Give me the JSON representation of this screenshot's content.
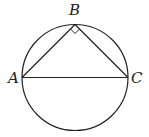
{
  "figure": {
    "type": "inscribed-triangle-in-circle",
    "stroke_color": "#222222"
  },
  "points": {
    "A": {
      "label": "A"
    },
    "B": {
      "label": "B"
    },
    "C": {
      "label": "C"
    }
  },
  "annotations": {
    "right_angle_at": "B"
  }
}
